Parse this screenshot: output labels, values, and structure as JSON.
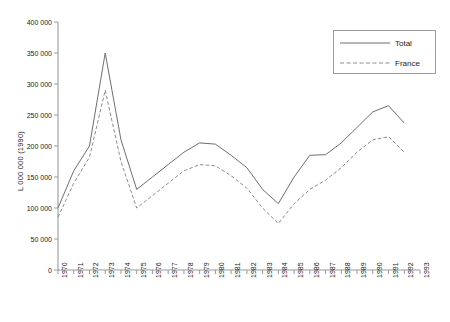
{
  "chart_data": {
    "type": "line",
    "title": "",
    "subtitle": "",
    "xlabel": "",
    "ylabel": "L 000 000 (1990)",
    "xlim": [
      1970,
      1993
    ],
    "ylim": [
      0,
      400000
    ],
    "grid": false,
    "legend_position": "top-right",
    "y_ticks": [
      0,
      50000,
      100000,
      150000,
      200000,
      250000,
      300000,
      350000,
      400000
    ],
    "y_tick_labels": [
      "0",
      "50 000",
      "100 000",
      "150 000",
      "200 000",
      "250 000",
      "300 000",
      "350 000",
      "400 000"
    ],
    "x": [
      1970,
      1971,
      1972,
      1973,
      1974,
      1975,
      1976,
      1977,
      1978,
      1979,
      1980,
      1981,
      1982,
      1983,
      1984,
      1985,
      1986,
      1987,
      1988,
      1989,
      1990,
      1991,
      1992
    ],
    "categories": [
      "1970",
      "1971",
      "1972",
      "1973",
      "1974",
      "1975",
      "1976",
      "1977",
      "1978",
      "1979",
      "1980",
      "1981",
      "1982",
      "1983",
      "1984",
      "1985",
      "1986",
      "1987",
      "1988",
      "1989",
      "1990",
      "1991",
      "1992"
    ],
    "x_tick_labels": [
      "1970",
      "1971",
      "1972",
      "1973",
      "1974",
      "1975",
      "1976",
      "1977",
      "1978",
      "1979",
      "1980",
      "1981",
      "1982",
      "1983",
      "1984",
      "1985",
      "1986",
      "1987",
      "1988",
      "1989",
      "1990",
      "1991",
      "1992",
      "1993"
    ],
    "series": [
      {
        "name": "Total",
        "style": "solid",
        "color": "#6e6e6e",
        "values": [
          100000,
          160000,
          200000,
          350000,
          210000,
          130000,
          150000,
          170000,
          190000,
          205000,
          203000,
          185000,
          165000,
          130000,
          107000,
          150000,
          185000,
          186000,
          205000,
          230000,
          255000,
          265000,
          237000
        ]
      },
      {
        "name": "France",
        "style": "dashed",
        "color": "#8c8c8c",
        "values": [
          85000,
          140000,
          182000,
          290000,
          175000,
          100000,
          120000,
          140000,
          160000,
          170000,
          168000,
          152000,
          132000,
          100000,
          75000,
          107000,
          130000,
          145000,
          165000,
          190000,
          210000,
          215000,
          190000
        ]
      }
    ]
  },
  "legend": {
    "items": [
      {
        "label": "Total",
        "style": "solid"
      },
      {
        "label": "France",
        "style": "dashed"
      }
    ]
  }
}
